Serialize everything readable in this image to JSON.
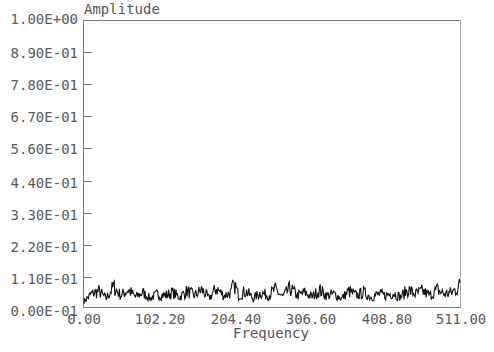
{
  "chart_data": {
    "type": "line",
    "title": "",
    "xlabel": "Frequency",
    "ylabel": "Amplitude",
    "xlim": [
      0,
      511
    ],
    "ylim": [
      0,
      1.0
    ],
    "grid": false,
    "legend": null,
    "x_ticks": [
      "0.00",
      "102.20",
      "204.40",
      "306.60",
      "408.80",
      "511.00"
    ],
    "y_ticks": [
      "0.00E-01",
      "1.10E-01",
      "2.20E-01",
      "3.30E-01",
      "4.40E-01",
      "5.60E-01",
      "6.70E-01",
      "7.80E-01",
      "8.90E-01",
      "1.00E+00"
    ],
    "series": [
      {
        "name": "Amplitude spectrum",
        "color": "#111111",
        "description": "Noise-like spectrum across all frequencies, amplitude roughly 0.01-0.08, max spike ~0.085 near frequency 204",
        "x": [
          0,
          10,
          20,
          30,
          40,
          50,
          60,
          70,
          80,
          90,
          100,
          110,
          120,
          130,
          140,
          150,
          160,
          170,
          180,
          190,
          200,
          204,
          210,
          220,
          230,
          240,
          250,
          260,
          270,
          280,
          290,
          300,
          310,
          320,
          330,
          340,
          350,
          360,
          370,
          380,
          390,
          400,
          410,
          420,
          430,
          440,
          450,
          460,
          470,
          480,
          490,
          500,
          511
        ],
        "values": [
          0.02,
          0.045,
          0.055,
          0.03,
          0.07,
          0.04,
          0.06,
          0.035,
          0.05,
          0.03,
          0.045,
          0.04,
          0.05,
          0.035,
          0.055,
          0.04,
          0.06,
          0.03,
          0.065,
          0.04,
          0.05,
          0.085,
          0.04,
          0.055,
          0.03,
          0.05,
          0.04,
          0.06,
          0.035,
          0.065,
          0.04,
          0.05,
          0.035,
          0.06,
          0.04,
          0.045,
          0.03,
          0.055,
          0.04,
          0.05,
          0.035,
          0.045,
          0.04,
          0.05,
          0.035,
          0.06,
          0.045,
          0.055,
          0.04,
          0.06,
          0.045,
          0.05,
          0.075
        ]
      }
    ]
  },
  "axes": {
    "ylabel": "Amplitude",
    "xlabel": "Frequency",
    "y_ticks": [
      "1.00E+00",
      "8.90E-01",
      "7.80E-01",
      "6.70E-01",
      "5.60E-01",
      "4.40E-01",
      "3.30E-01",
      "2.20E-01",
      "1.10E-01",
      "0.00E-01"
    ],
    "x_ticks": [
      "0.00",
      "102.20",
      "204.40",
      "306.60",
      "408.80",
      "511.00"
    ]
  }
}
